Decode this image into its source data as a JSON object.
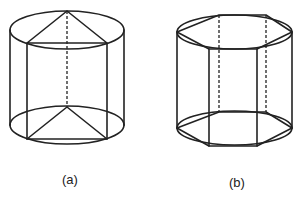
{
  "figures": [
    {
      "id": "a",
      "label": "(a)",
      "description": "Cylinder with inscribed triangular prism",
      "cylinder": {
        "cx": 67,
        "top_cy": 30,
        "bottom_cy": 125,
        "rx": 57,
        "ry": 19
      },
      "prism_base": "triangle",
      "top_vertices": [
        [
          67,
          11
        ],
        [
          27,
          43
        ],
        [
          107,
          43
        ]
      ],
      "bottom_vertices": [
        [
          67,
          107
        ],
        [
          27,
          139
        ],
        [
          107,
          139
        ]
      ],
      "hidden_edges": [
        [
          [
            67,
            11
          ],
          [
            67,
            107
          ]
        ]
      ]
    },
    {
      "id": "b",
      "label": "(b)",
      "description": "Cylinder with inscribed hexagonal prism",
      "cylinder": {
        "cx": 234.5,
        "top_cy": 32,
        "bottom_cy": 128,
        "rx": 57.5,
        "ry": 17
      },
      "prism_base": "hexagon",
      "top_vertices": [
        [
          177,
          32
        ],
        [
          219,
          15
        ],
        [
          266,
          15
        ],
        [
          292,
          32
        ],
        [
          257,
          49
        ],
        [
          209,
          49
        ]
      ],
      "bottom_vertices": [
        [
          177,
          128
        ],
        [
          219,
          112
        ],
        [
          266,
          112
        ],
        [
          292,
          128
        ],
        [
          257,
          146
        ],
        [
          209,
          146
        ]
      ],
      "hidden_edges": [
        [
          [
            219,
            15
          ],
          [
            219,
            112
          ]
        ],
        [
          [
            266,
            15
          ],
          [
            266,
            112
          ]
        ]
      ]
    }
  ],
  "colors": {
    "stroke": "#222222",
    "background": "#ffffff"
  }
}
